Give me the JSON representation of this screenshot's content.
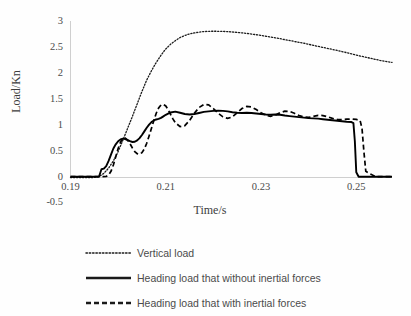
{
  "chart_data": {
    "type": "line",
    "title": "",
    "xlabel": "Time/s",
    "ylabel": "Load/Kn",
    "xlim": [
      0.19,
      0.2575
    ],
    "ylim": [
      -0.5,
      3
    ],
    "grid": false,
    "legend_position": "bottom",
    "xticks": [
      "0.19",
      "0.21",
      "0.23",
      "0.25"
    ],
    "xtick_values": [
      0.19,
      0.21,
      0.23,
      0.25
    ],
    "yticks": [
      "-0.5",
      "0",
      "0.5",
      "1",
      "1.5",
      "2",
      "2.5",
      "3"
    ],
    "ytick_values": [
      -0.5,
      0,
      0.5,
      1,
      1.5,
      2,
      2.5,
      3
    ],
    "series": [
      {
        "name": "Vertical load",
        "style": "dotted",
        "color": "#1a1a1a",
        "x": [
          0.19,
          0.1925,
          0.195,
          0.196,
          0.197,
          0.198,
          0.199,
          0.2,
          0.201,
          0.202,
          0.203,
          0.204,
          0.205,
          0.206,
          0.207,
          0.208,
          0.209,
          0.21,
          0.211,
          0.212,
          0.213,
          0.214,
          0.215,
          0.216,
          0.217,
          0.218,
          0.219,
          0.22,
          0.2215,
          0.223,
          0.225,
          0.227,
          0.229,
          0.231,
          0.233,
          0.235,
          0.237,
          0.239,
          0.241,
          0.243,
          0.245,
          0.247,
          0.249,
          0.251,
          0.253,
          0.255,
          0.2575
        ],
        "y": [
          0.0,
          0.0,
          0.0,
          0.02,
          0.08,
          0.18,
          0.32,
          0.5,
          0.72,
          0.95,
          1.18,
          1.42,
          1.66,
          1.88,
          2.06,
          2.22,
          2.36,
          2.48,
          2.57,
          2.64,
          2.7,
          2.74,
          2.77,
          2.79,
          2.805,
          2.815,
          2.82,
          2.822,
          2.82,
          2.815,
          2.8,
          2.78,
          2.755,
          2.725,
          2.695,
          2.66,
          2.625,
          2.59,
          2.55,
          2.51,
          2.47,
          2.43,
          2.385,
          2.34,
          2.3,
          2.26,
          2.22
        ]
      },
      {
        "name": "Heading load that without inertial forces",
        "style": "solid",
        "color": "#000000",
        "x": [
          0.19,
          0.194,
          0.196,
          0.1965,
          0.197,
          0.1975,
          0.198,
          0.1985,
          0.199,
          0.1995,
          0.2,
          0.2005,
          0.201,
          0.2015,
          0.202,
          0.2025,
          0.203,
          0.2035,
          0.204,
          0.2045,
          0.205,
          0.2055,
          0.206,
          0.2065,
          0.207,
          0.2075,
          0.208,
          0.2085,
          0.209,
          0.2095,
          0.21,
          0.211,
          0.212,
          0.213,
          0.214,
          0.215,
          0.216,
          0.217,
          0.218,
          0.219,
          0.22,
          0.221,
          0.222,
          0.223,
          0.224,
          0.225,
          0.226,
          0.227,
          0.228,
          0.229,
          0.23,
          0.231,
          0.232,
          0.233,
          0.234,
          0.235,
          0.236,
          0.237,
          0.238,
          0.239,
          0.24,
          0.241,
          0.242,
          0.243,
          0.244,
          0.245,
          0.246,
          0.247,
          0.248,
          0.249,
          0.2494,
          0.2497,
          0.25,
          0.2505,
          0.253,
          0.2575
        ],
        "y": [
          0.015,
          0.015,
          0.02,
          0.16,
          0.17,
          0.22,
          0.32,
          0.44,
          0.56,
          0.64,
          0.7,
          0.735,
          0.75,
          0.74,
          0.72,
          0.7,
          0.685,
          0.69,
          0.715,
          0.76,
          0.82,
          0.89,
          0.96,
          1.02,
          1.07,
          1.1,
          1.12,
          1.13,
          1.15,
          1.18,
          1.21,
          1.255,
          1.27,
          1.25,
          1.225,
          1.215,
          1.225,
          1.245,
          1.265,
          1.275,
          1.285,
          1.29,
          1.285,
          1.275,
          1.26,
          1.25,
          1.245,
          1.25,
          1.245,
          1.235,
          1.225,
          1.215,
          1.21,
          1.215,
          1.21,
          1.195,
          1.185,
          1.175,
          1.165,
          1.155,
          1.145,
          1.14,
          1.135,
          1.125,
          1.115,
          1.105,
          1.095,
          1.085,
          1.075,
          1.07,
          1.05,
          0.7,
          0.1,
          0.015,
          0.015,
          0.015
        ]
      },
      {
        "name": "Heading load that with inertial forces",
        "style": "dashed",
        "color": "#000000",
        "x": [
          0.19,
          0.194,
          0.1965,
          0.1975,
          0.198,
          0.1985,
          0.199,
          0.1995,
          0.2,
          0.2005,
          0.201,
          0.2015,
          0.202,
          0.2025,
          0.203,
          0.2035,
          0.204,
          0.2045,
          0.205,
          0.2055,
          0.206,
          0.2065,
          0.207,
          0.2075,
          0.208,
          0.2085,
          0.209,
          0.2095,
          0.21,
          0.2105,
          0.211,
          0.2115,
          0.212,
          0.213,
          0.214,
          0.215,
          0.216,
          0.217,
          0.218,
          0.219,
          0.22,
          0.221,
          0.222,
          0.223,
          0.224,
          0.225,
          0.226,
          0.227,
          0.228,
          0.229,
          0.23,
          0.231,
          0.232,
          0.233,
          0.234,
          0.235,
          0.236,
          0.237,
          0.238,
          0.239,
          0.24,
          0.241,
          0.242,
          0.243,
          0.244,
          0.245,
          0.246,
          0.247,
          0.248,
          0.249,
          0.25,
          0.2508,
          0.2512,
          0.2516,
          0.252,
          0.254,
          0.2575
        ],
        "y": [
          0.015,
          0.015,
          0.015,
          0.02,
          0.05,
          0.12,
          0.24,
          0.4,
          0.56,
          0.68,
          0.75,
          0.76,
          0.72,
          0.65,
          0.57,
          0.5,
          0.46,
          0.45,
          0.48,
          0.55,
          0.66,
          0.8,
          0.95,
          1.1,
          1.24,
          1.34,
          1.4,
          1.41,
          1.38,
          1.31,
          1.22,
          1.13,
          1.06,
          0.98,
          1.0,
          1.1,
          1.24,
          1.35,
          1.41,
          1.4,
          1.33,
          1.24,
          1.17,
          1.14,
          1.17,
          1.25,
          1.33,
          1.37,
          1.36,
          1.31,
          1.25,
          1.2,
          1.18,
          1.205,
          1.25,
          1.28,
          1.275,
          1.24,
          1.195,
          1.165,
          1.16,
          1.18,
          1.2,
          1.195,
          1.17,
          1.14,
          1.12,
          1.115,
          1.125,
          1.13,
          1.12,
          1.1,
          0.95,
          0.5,
          0.12,
          0.015,
          0.015
        ]
      }
    ]
  },
  "legend": {
    "items": [
      {
        "label": "Vertical load",
        "style": "dotted"
      },
      {
        "label": "Heading load that without inertial forces",
        "style": "solid"
      },
      {
        "label": "Heading load that with inertial forces",
        "style": "dashed"
      }
    ]
  }
}
